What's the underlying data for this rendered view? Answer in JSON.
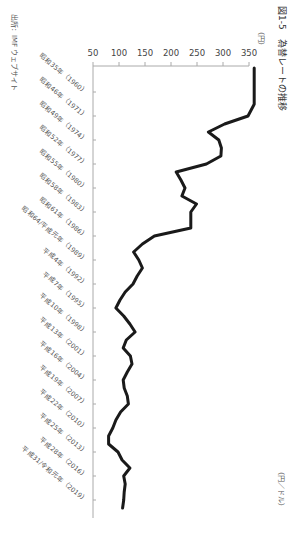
{
  "chart_data": {
    "type": "line",
    "title": "図1-5　為替レートの推移",
    "ylabel": "（円）",
    "unit_label": "（円／ドル）",
    "source": "出所：IMF ウェブサイト",
    "ylim": [
      50,
      350
    ],
    "yticks": [
      50,
      100,
      150,
      200,
      250,
      300,
      350
    ],
    "xlabel": "",
    "x_tick_labels": [
      "昭和35年（1960）",
      "昭和46年（1971）",
      "昭和49年（1974）",
      "昭和52年（1977）",
      "昭和55年（1980）",
      "昭和58年（1983）",
      "昭和61年（1986）",
      "昭和64/平成元年（1989）",
      "平成4年（1992）",
      "平成7年（1995）",
      "平成10年（1998）",
      "平成13年（2001）",
      "平成16年（2004）",
      "平成19年（2007）",
      "平成22年（2010）",
      "平成25年（2013）",
      "平成28年（2016）",
      "平成31/令和元年（2019）"
    ],
    "x_tick_years": [
      1960,
      1971,
      1974,
      1977,
      1980,
      1983,
      1986,
      1989,
      1992,
      1995,
      1998,
      2001,
      2004,
      2007,
      2010,
      2013,
      2016,
      2019
    ],
    "grid": false,
    "legend": "none",
    "series": [
      {
        "name": "円／ドル",
        "x": [
          1960,
          1970,
          1971,
          1972,
          1973,
          1974,
          1975,
          1976,
          1977,
          1978,
          1979,
          1980,
          1981,
          1982,
          1983,
          1984,
          1985,
          1986,
          1987,
          1988,
          1989,
          1990,
          1991,
          1992,
          1993,
          1994,
          1995,
          1996,
          1997,
          1998,
          1999,
          2000,
          2001,
          2002,
          2003,
          2004,
          2005,
          2006,
          2007,
          2008,
          2009,
          2010,
          2011,
          2012,
          2013,
          2014,
          2015,
          2016,
          2017,
          2018,
          2019,
          2020
        ],
        "values": [
          360,
          360,
          348,
          303,
          272,
          292,
          297,
          296,
          268,
          210,
          219,
          227,
          221,
          249,
          238,
          238,
          238,
          168,
          145,
          128,
          138,
          145,
          135,
          127,
          112,
          102,
          94,
          109,
          121,
          131,
          114,
          108,
          122,
          125,
          116,
          108,
          110,
          116,
          118,
          103,
          94,
          88,
          80,
          80,
          98,
          106,
          121,
          109,
          112,
          110,
          109,
          107
        ]
      }
    ]
  }
}
